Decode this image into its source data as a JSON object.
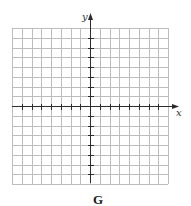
{
  "figure": {
    "label": "G",
    "x_axis_label": "x",
    "y_axis_label": "y"
  },
  "grid": {
    "columns": 16,
    "rows": 16,
    "left": 12,
    "top": 28,
    "cell_size": 9.75,
    "origin_col": 8,
    "origin_row": 8,
    "line_color": "#bdbdbd",
    "axis_color": "#2b2b2b"
  },
  "axes": {
    "x_ticks_left": 7,
    "x_ticks_right": 7,
    "y_ticks_above": 7,
    "y_ticks_below": 7,
    "x_arrow": "right",
    "y_arrow": "up"
  }
}
